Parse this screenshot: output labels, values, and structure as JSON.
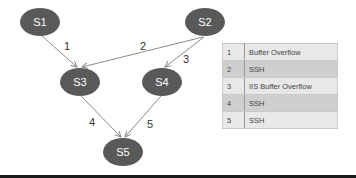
{
  "graph": {
    "nodes": [
      {
        "id": "S1",
        "label": "S1",
        "cx": 40,
        "cy": 22
      },
      {
        "id": "S2",
        "label": "S2",
        "cx": 205,
        "cy": 22
      },
      {
        "id": "S3",
        "label": "S3",
        "cx": 80,
        "cy": 82
      },
      {
        "id": "S4",
        "label": "S4",
        "cx": 162,
        "cy": 82
      },
      {
        "id": "S5",
        "label": "S5",
        "cx": 123,
        "cy": 152
      }
    ],
    "edges": [
      {
        "from": "S1",
        "to": "S3",
        "label": "1"
      },
      {
        "from": "S2",
        "to": "S3",
        "label": "2"
      },
      {
        "from": "S2",
        "to": "S4",
        "label": "3"
      },
      {
        "from": "S3",
        "to": "S5",
        "label": "4"
      },
      {
        "from": "S4",
        "to": "S5",
        "label": "5"
      }
    ],
    "node_color": "#595959",
    "edge_color": "#8c8c8c"
  },
  "legend": {
    "rows": [
      {
        "num": "1",
        "name": "Buffer Overflow"
      },
      {
        "num": "2",
        "name": "SSH"
      },
      {
        "num": "3",
        "name": "IIS Buffer Overflow"
      },
      {
        "num": "4",
        "name": "SSH"
      },
      {
        "num": "5",
        "name": "SSH"
      }
    ]
  }
}
